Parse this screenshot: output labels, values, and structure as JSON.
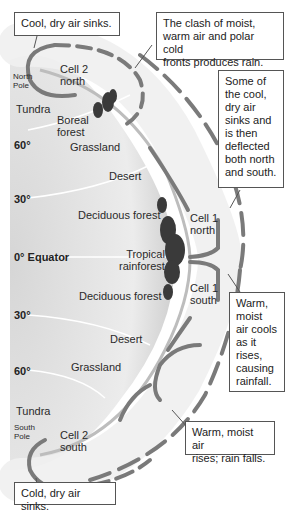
{
  "diagram": {
    "type": "atmospheric-circulation-cells",
    "colors": {
      "background": "#ffffff",
      "earth_surface": "#e4e4e4",
      "earth_shadow": "#c9c9c9",
      "atmosphere_band": "#f1f1f1",
      "arrows": "#7a7a7a",
      "vegetation": "#3a3a3a",
      "text": "#222222",
      "callout_border": "#555555"
    },
    "latitudes": [
      {
        "label": "60°",
        "position": "north"
      },
      {
        "label": "30°",
        "position": "north"
      },
      {
        "label": "0° Equator",
        "position": "equator"
      },
      {
        "label": "30°",
        "position": "south"
      },
      {
        "label": "60°",
        "position": "south"
      }
    ],
    "poles": {
      "north": "North\nPole",
      "south": "South\nPole"
    },
    "biomes": {
      "tundra_north": "Tundra",
      "boreal_forest": "Boreal\nforest",
      "grassland_north": "Grassland",
      "desert_north": "Desert",
      "deciduous_north": "Deciduous forest",
      "tropical_rainforest": "Tropical\nrainforest",
      "deciduous_south": "Deciduous forest",
      "desert_south": "Desert",
      "grassland_south": "Grassland",
      "tundra_south": "Tundra"
    },
    "cells": {
      "cell2_north": "Cell 2\nnorth",
      "cell1_north": "Cell 1\nnorth",
      "cell1_south": "Cell 1\nsouth",
      "cell2_south": "Cell 2\nsouth"
    },
    "callouts": {
      "cool_dry_sinks": "Cool, dry air sinks.",
      "clash_fronts": "The clash of moist,\nwarm air and polar cold\nfronts produces rain.",
      "deflected": "Some of\nthe cool,\ndry air\nsinks and\nis then\ndeflected\nboth north\nand south.",
      "warm_moist_cools": "Warm,\nmoist\nair cools\nas it\nrises,\ncausing\nrainfall.",
      "warm_rises_rain": "Warm, moist air\nrises; rain falls.",
      "cold_dry_sinks": "Cold, dry air sinks."
    }
  }
}
